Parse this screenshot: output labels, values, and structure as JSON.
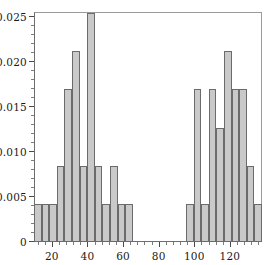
{
  "chart_data": {
    "type": "bar",
    "title": "",
    "subtitle": "",
    "xlabel": "",
    "ylabel": "",
    "grid": false,
    "legend": null,
    "xlim": [
      10.0,
      138.0
    ],
    "ylim": [
      0.0,
      0.0255
    ],
    "bin_width": 4.2667,
    "x_tick_labels": [
      "20",
      "40",
      "60",
      "80",
      "100",
      "120"
    ],
    "x_tick_values": [
      20,
      40,
      60,
      80,
      100,
      120
    ],
    "x_minor_step": 4,
    "y_tick_labels": [
      "0",
      "0.005",
      "0.010",
      "0.015",
      "0.020",
      "0.025"
    ],
    "y_tick_values": [
      0,
      0.005,
      0.01,
      0.015,
      0.02,
      0.025
    ],
    "y_minor_step": 0.001,
    "bin_edges": [
      10.0,
      14.27,
      18.53,
      22.8,
      27.07,
      31.33,
      35.6,
      39.87,
      44.13,
      48.4,
      52.67,
      56.93,
      61.2,
      65.47,
      69.73,
      74.0,
      78.27,
      82.53,
      86.8,
      91.07,
      95.33,
      99.6,
      103.87,
      108.13,
      112.4,
      116.67,
      120.93,
      125.2,
      129.47,
      133.73,
      138.0
    ],
    "bin_centers": [
      12.13,
      16.4,
      20.67,
      24.93,
      29.2,
      33.47,
      37.73,
      42.0,
      46.27,
      50.53,
      54.8,
      59.07,
      63.33,
      67.6,
      71.87,
      76.13,
      80.4,
      84.67,
      88.93,
      93.2,
      97.47,
      101.73,
      106.0,
      110.27,
      114.53,
      118.8,
      123.07,
      127.33,
      131.6,
      135.87
    ],
    "values": [
      0.00423,
      0.00423,
      0.00423,
      0.00846,
      0.01692,
      0.02115,
      0.00846,
      0.02538,
      0.00846,
      0.00423,
      0.00846,
      0.00423,
      0.00423,
      0.0,
      0.0,
      0.0,
      0.0,
      0.0,
      0.0,
      0.0,
      0.00423,
      0.01692,
      0.00423,
      0.01692,
      0.01269,
      0.02115,
      0.01692,
      0.01692,
      0.00846,
      0.00423
    ],
    "counts_units": [
      1,
      1,
      1,
      2,
      4,
      5,
      2,
      6,
      2,
      1,
      2,
      1,
      1,
      0,
      0,
      0,
      0,
      0,
      0,
      0,
      1,
      4,
      1,
      4,
      3,
      5,
      4,
      4,
      2,
      1
    ],
    "unit_density": 0.004231,
    "bar_fill_color": "#c9c9c9",
    "bar_edge_color": "#6b6b6b",
    "frame_color": "#6e6e6e",
    "background_color": "#ffffff"
  }
}
